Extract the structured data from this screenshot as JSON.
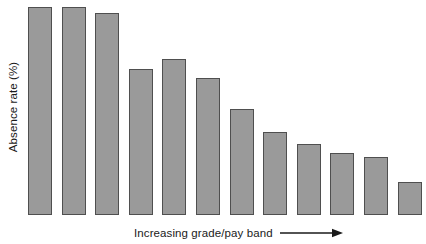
{
  "chart_data": {
    "type": "bar",
    "title": "",
    "subtitle": "",
    "xlabel": "Increasing grade/pay band",
    "ylabel": "Absence rate (%)",
    "categories": [
      "1",
      "2",
      "3",
      "4",
      "5",
      "6",
      "7",
      "8",
      "9",
      "10",
      "11",
      "12"
    ],
    "values": [
      100,
      100,
      97,
      70,
      75,
      66,
      51,
      40,
      34,
      30,
      28,
      16
    ],
    "ylim": [
      0,
      100
    ],
    "xlim": null,
    "grid": false,
    "legend": null,
    "series": [
      {
        "name": "Absence rate",
        "values": [
          100,
          100,
          97,
          70,
          75,
          66,
          51,
          40,
          34,
          30,
          28,
          16
        ]
      }
    ],
    "annotations": [
      {
        "name": "x-axis-direction-arrow",
        "text": "Increasing grade/pay band",
        "glyph": "right-arrow"
      }
    ],
    "axis_tick_labels": {
      "x": [],
      "y": []
    },
    "colors": {
      "bar_fill": "#9a9a9a",
      "bar_stroke": "#4f4f4f",
      "background": "#ffffff",
      "text": "#1a1a1a"
    }
  },
  "figure": {
    "y_axis_label": "Absence rate (%)",
    "x_axis_label": "Increasing grade/pay band"
  }
}
